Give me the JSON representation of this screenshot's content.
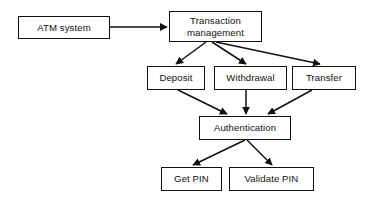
{
  "diagram": {
    "type": "flowchart",
    "background_color": "#ffffff",
    "stroke_color": "#111111",
    "text_color": "#111111",
    "nodes": [
      {
        "id": "atm_system",
        "label": "ATM system",
        "x": 18,
        "y": 16,
        "w": 92,
        "h": 23
      },
      {
        "id": "transaction_management",
        "label": "Transaction\nmanagement",
        "x": 169,
        "y": 11,
        "w": 93,
        "h": 31
      },
      {
        "id": "deposit",
        "label": "Deposit",
        "x": 147,
        "y": 66,
        "w": 58,
        "h": 24
      },
      {
        "id": "withdrawal",
        "label": "Withdrawal",
        "x": 214,
        "y": 66,
        "w": 73,
        "h": 24
      },
      {
        "id": "transfer",
        "label": "Transfer",
        "x": 292,
        "y": 66,
        "w": 64,
        "h": 24
      },
      {
        "id": "authentication",
        "label": "Authentication",
        "x": 199,
        "y": 116,
        "w": 92,
        "h": 24
      },
      {
        "id": "get_pin",
        "label": "Get PIN",
        "x": 161,
        "y": 167,
        "w": 61,
        "h": 24
      },
      {
        "id": "validate_pin",
        "label": "Validate PIN",
        "x": 229,
        "y": 167,
        "w": 85,
        "h": 24
      }
    ],
    "edges": [
      {
        "id": "e1",
        "from": "atm_system",
        "to": "transaction_management",
        "x1": 110,
        "y1": 27,
        "x2": 167,
        "y2": 27
      },
      {
        "id": "e2",
        "from": "transaction_management",
        "to": "deposit",
        "x1": 206,
        "y1": 42,
        "x2": 176,
        "y2": 64
      },
      {
        "id": "e3",
        "from": "transaction_management",
        "to": "withdrawal",
        "x1": 212,
        "y1": 42,
        "x2": 246,
        "y2": 64
      },
      {
        "id": "e4",
        "from": "transaction_management",
        "to": "transfer",
        "x1": 216,
        "y1": 42,
        "x2": 320,
        "y2": 64
      },
      {
        "id": "e5",
        "from": "deposit",
        "to": "authentication",
        "x1": 178,
        "y1": 90,
        "x2": 227,
        "y2": 114
      },
      {
        "id": "e6",
        "from": "withdrawal",
        "to": "authentication",
        "x1": 246,
        "y1": 90,
        "x2": 246,
        "y2": 114
      },
      {
        "id": "e7",
        "from": "transfer",
        "to": "authentication",
        "x1": 312,
        "y1": 90,
        "x2": 268,
        "y2": 114
      },
      {
        "id": "e8",
        "from": "authentication",
        "to": "get_pin",
        "x1": 245,
        "y1": 140,
        "x2": 193,
        "y2": 165
      },
      {
        "id": "e9",
        "from": "authentication",
        "to": "validate_pin",
        "x1": 247,
        "y1": 140,
        "x2": 272,
        "y2": 165
      }
    ]
  }
}
